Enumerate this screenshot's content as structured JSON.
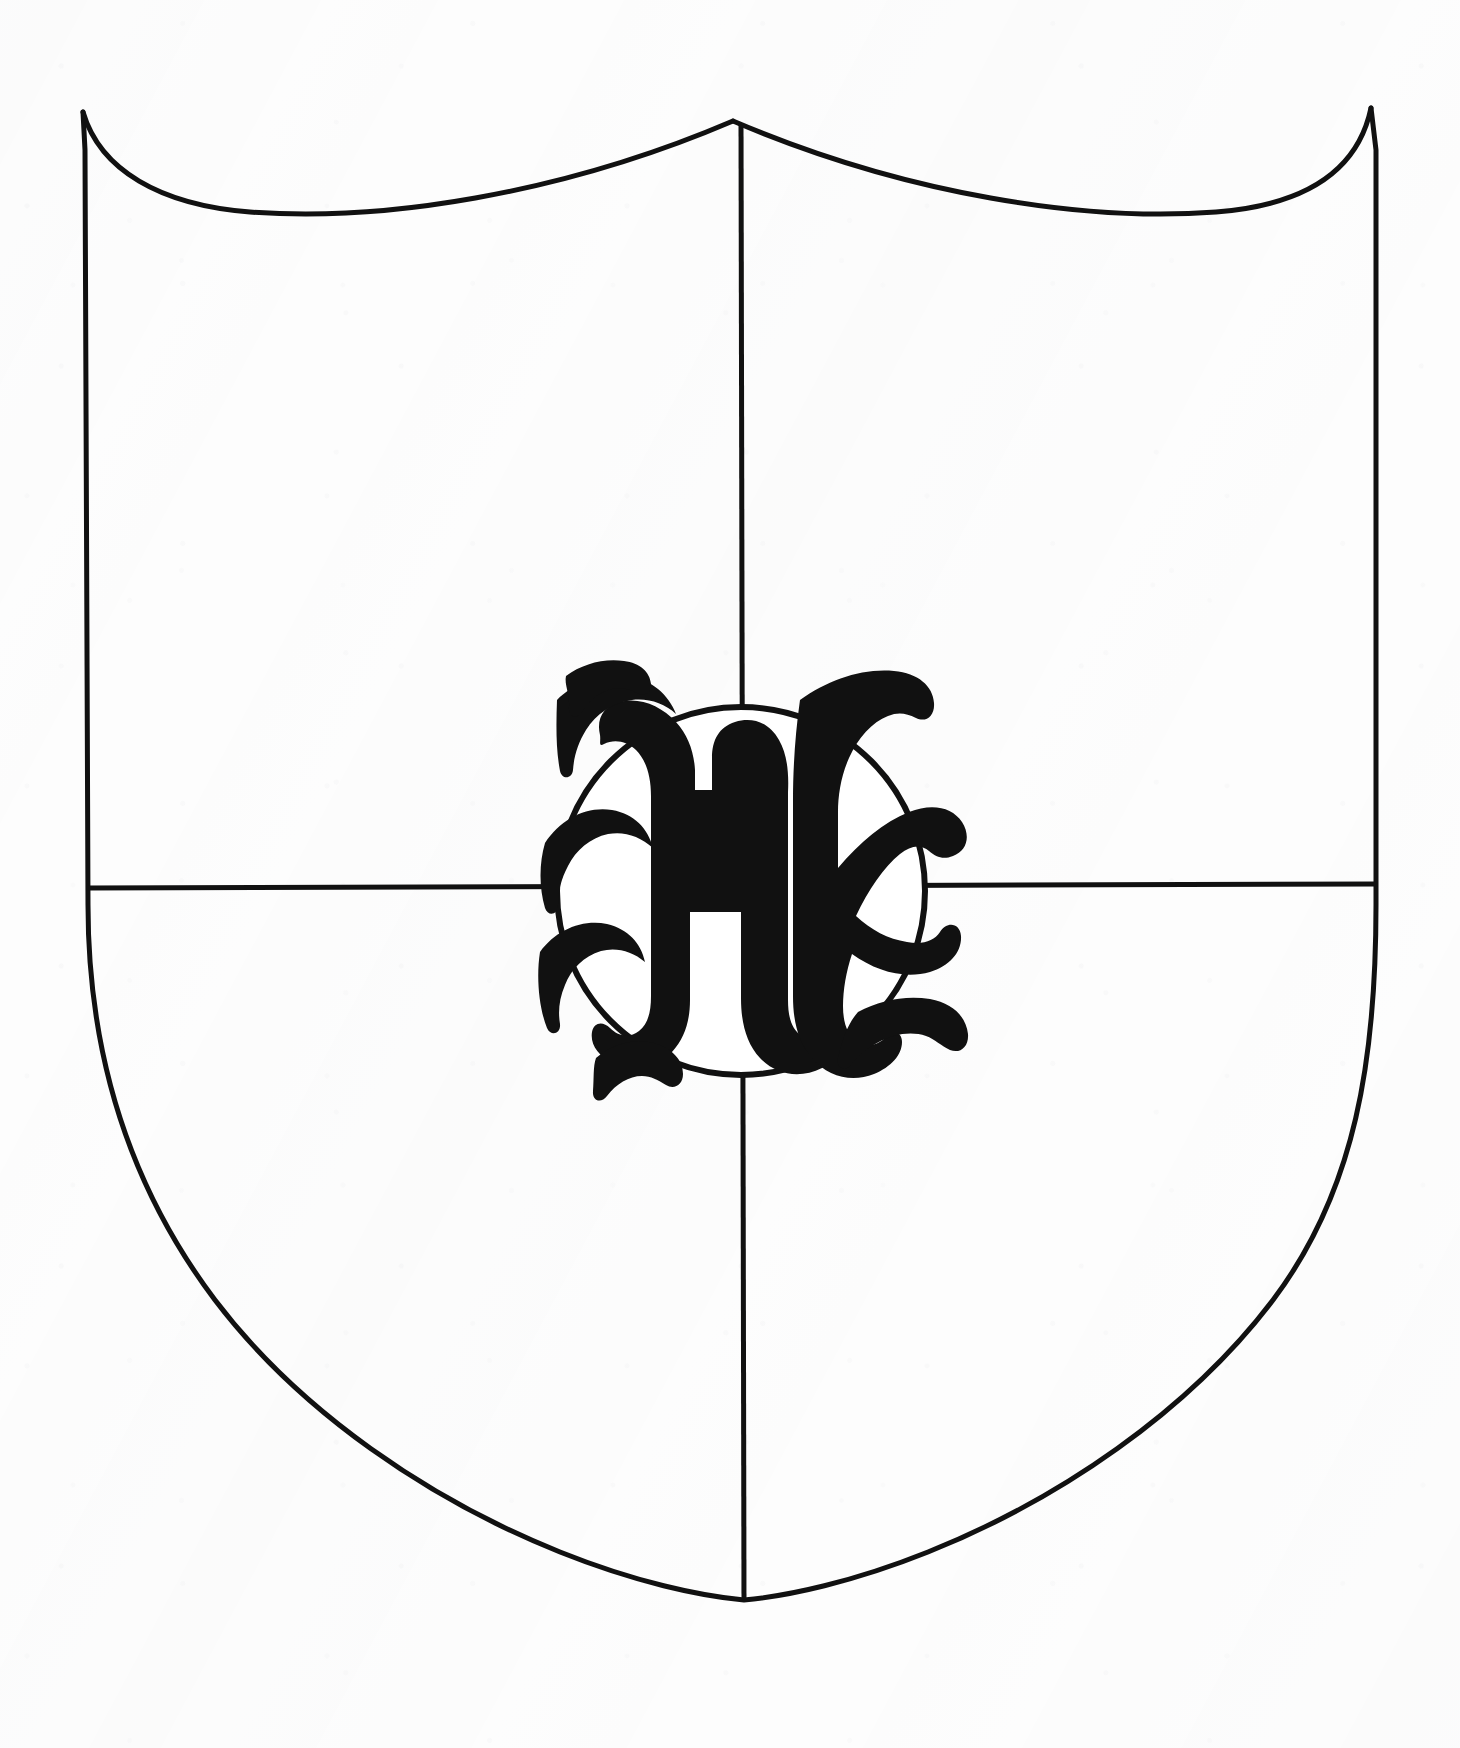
{
  "document": {
    "title": "Heraldic Shield — Quarterly with Inescutcheon Roundel",
    "medium": "black ink line drawing on scanned white paper",
    "background_color": "#fdfdfd",
    "ink_color": "#111111"
  },
  "shield": {
    "name": "heraldic-shield",
    "outline_color": "#111111",
    "outline_width_px": 5,
    "fill": "none",
    "geometry": {
      "top_left_corner": [
        83,
        112
      ],
      "top_right_corner": [
        1371,
        108
      ],
      "top_center_peak": [
        733,
        121
      ],
      "bottom_point": [
        744,
        1600
      ],
      "left_edge_x": 88,
      "right_edge_x": 1376,
      "flank_end_y": 905
    },
    "description": "Shield with bi-arched (double-scalloped) chief and pointed base"
  },
  "divisions": {
    "name": "quarterly-division",
    "pale": {
      "label": "vertical-division-line",
      "x": 741,
      "from_y": 121,
      "to_y": 1600,
      "stroke_width_px": 5
    },
    "fess": {
      "label": "horizontal-division-line",
      "y": 888,
      "from_x": 88,
      "to_x": 1376,
      "stroke_width_px": 5
    }
  },
  "roundel": {
    "name": "center-roundel",
    "center": [
      741,
      891
    ],
    "radius_px": 184,
    "stroke_color": "#111111",
    "stroke_width_px": 6,
    "fill_color": "#ffffff",
    "charge": {
      "name": "blackletter-h",
      "letter": "H",
      "style": "blackletter / Old English capital",
      "color": "#111111",
      "font_size_px": 330,
      "position": [
        741,
        893
      ]
    }
  },
  "quarters": [
    {
      "name": "quarter-1-dexter-chief",
      "label": "1",
      "position": "upper left",
      "tincture": "plain (argent)"
    },
    {
      "name": "quarter-2-sinister-chief",
      "label": "2",
      "position": "upper right",
      "tincture": "plain (argent)"
    },
    {
      "name": "quarter-3-dexter-base",
      "label": "3",
      "position": "lower left",
      "tincture": "plain (argent)"
    },
    {
      "name": "quarter-4-sinister-base",
      "label": "4",
      "position": "lower right",
      "tincture": "plain (argent)"
    }
  ]
}
